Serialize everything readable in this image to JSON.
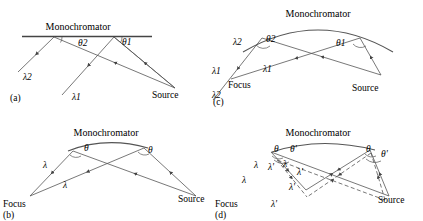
{
  "figure": {
    "background_color": "#ffffff",
    "line_color": "#444444",
    "text_color": "#1a1a1a",
    "width": 423,
    "height": 221
  },
  "panels": [
    {
      "id": "a",
      "caption": "(a)",
      "monochromator_shape": "flat",
      "title": "Monochromator",
      "labels": {
        "lambda2": "λ2",
        "lambda1": "λ1",
        "theta2": "θ2",
        "theta1": "θ1",
        "source": "Source"
      }
    },
    {
      "id": "b",
      "caption": "(b)",
      "monochromator_shape": "curved",
      "title": "Monochromator",
      "labels": {
        "lambda_upper": "λ",
        "lambda_lower": "λ",
        "theta_left": "θ",
        "theta_right": "θ",
        "focus": "Focus",
        "source": "Source"
      }
    },
    {
      "id": "c",
      "caption": "(c)",
      "monochromator_shape": "curved",
      "title": "Monochromator",
      "labels": {
        "lambda2_upper": "λ2",
        "lambda1_mid": "λ1",
        "lambda1_left": "λ1",
        "lambda2_left": "λ2",
        "theta2": "θ2",
        "theta1": "θ1",
        "focus": "Focus",
        "source": "Source"
      }
    },
    {
      "id": "d",
      "caption": "(d)",
      "monochromator_shape": "curved",
      "title": "Monochromator",
      "labels": {
        "lambda_a": "λ",
        "lambda_b": "λ",
        "lambda_c": "λ",
        "lambda_prime_a": "λ'",
        "lambda_prime_b": "λ'",
        "lambda_prime_c": "λ'",
        "lambda_prime_d": "λ'",
        "theta_left": "θ",
        "theta_prime_left": "θ'",
        "theta_right": "θ",
        "theta_prime_right": "θ'",
        "focus": "Focus",
        "source": "Source"
      }
    }
  ]
}
